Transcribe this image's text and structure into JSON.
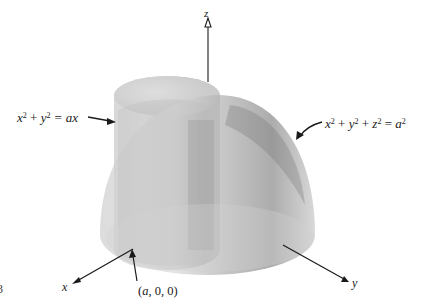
{
  "figure": {
    "axes": {
      "x_label": "x",
      "y_label": "y",
      "z_label": "z"
    },
    "annotations": {
      "cylinder_eq": {
        "lhs_x": "x",
        "lhs_y": "y",
        "exp": "2",
        "rhs": "= ax",
        "plus": "+"
      },
      "sphere_eq": {
        "lhs_x": "x",
        "lhs_y": "y",
        "lhs_z": "z",
        "exp": "2",
        "rhs_a": "a",
        "eq": "=",
        "plus": "+"
      },
      "point": {
        "open": "(",
        "a": "a",
        "rest": ", 0, 0)"
      }
    },
    "figure_number_fragment": "3",
    "colors": {
      "axis": "#1a1a1a",
      "surface_light": "#d8d8d8",
      "surface_mid": "#b4b4b4",
      "surface_dark": "#7a7a7a"
    }
  }
}
